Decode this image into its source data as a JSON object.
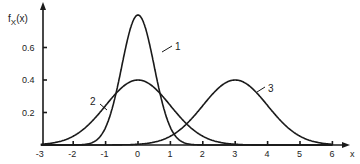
{
  "chart_data": {
    "type": "line",
    "title": "",
    "xlabel": "x",
    "ylabel": "f_X(x)",
    "ylabel_main": "f",
    "ylabel_sub": "X",
    "ylabel_arg": "(x)",
    "xlim": [
      -3,
      6
    ],
    "ylim": [
      0,
      0.8
    ],
    "grid": false,
    "legend": "inline numeric labels",
    "x_ticks": [
      "-3",
      "-2",
      "-1",
      "0",
      "1",
      "2",
      "3",
      "4",
      "5",
      "6"
    ],
    "y_ticks": [
      "0.2",
      "0.4",
      "0.6"
    ],
    "series": [
      {
        "name": "1",
        "distribution": "normal",
        "mean": 0,
        "std": 0.5,
        "peak": 0.8,
        "x": [
          -3,
          -2,
          -1.5,
          -1,
          -0.5,
          0,
          0.5,
          1,
          1.5,
          2,
          3
        ],
        "values": [
          0.0,
          0.0003,
          0.0089,
          0.108,
          0.484,
          0.798,
          0.484,
          0.108,
          0.0089,
          0.0003,
          0.0
        ]
      },
      {
        "name": "2",
        "distribution": "normal",
        "mean": 0,
        "std": 1,
        "peak": 0.4,
        "x": [
          -3,
          -2,
          -1,
          0,
          1,
          2,
          3
        ],
        "values": [
          0.0044,
          0.054,
          0.242,
          0.399,
          0.242,
          0.054,
          0.0044
        ]
      },
      {
        "name": "3",
        "distribution": "normal",
        "mean": 3,
        "std": 1,
        "peak": 0.4,
        "x": [
          0,
          1,
          2,
          3,
          4,
          5,
          6
        ],
        "values": [
          0.0044,
          0.054,
          0.242,
          0.399,
          0.242,
          0.054,
          0.0044
        ]
      }
    ]
  }
}
